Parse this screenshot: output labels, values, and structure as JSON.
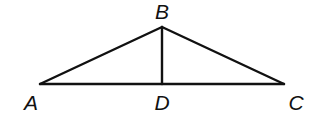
{
  "diagram": {
    "type": "triangle-with-altitude",
    "points": {
      "A": {
        "label": "A",
        "x": 40,
        "y": 84
      },
      "B": {
        "label": "B",
        "x": 162,
        "y": 27
      },
      "C": {
        "label": "C",
        "x": 284,
        "y": 84
      },
      "D": {
        "label": "D",
        "x": 162,
        "y": 84
      }
    },
    "segments": [
      {
        "name": "AB",
        "from": "A",
        "to": "B"
      },
      {
        "name": "BC",
        "from": "B",
        "to": "C"
      },
      {
        "name": "AC",
        "from": "A",
        "to": "C"
      },
      {
        "name": "BD",
        "from": "B",
        "to": "D"
      }
    ],
    "labels": {
      "A": "A",
      "B": "B",
      "C": "C",
      "D": "D"
    },
    "colors": {
      "stroke": "#111111",
      "background": "#ffffff"
    }
  }
}
